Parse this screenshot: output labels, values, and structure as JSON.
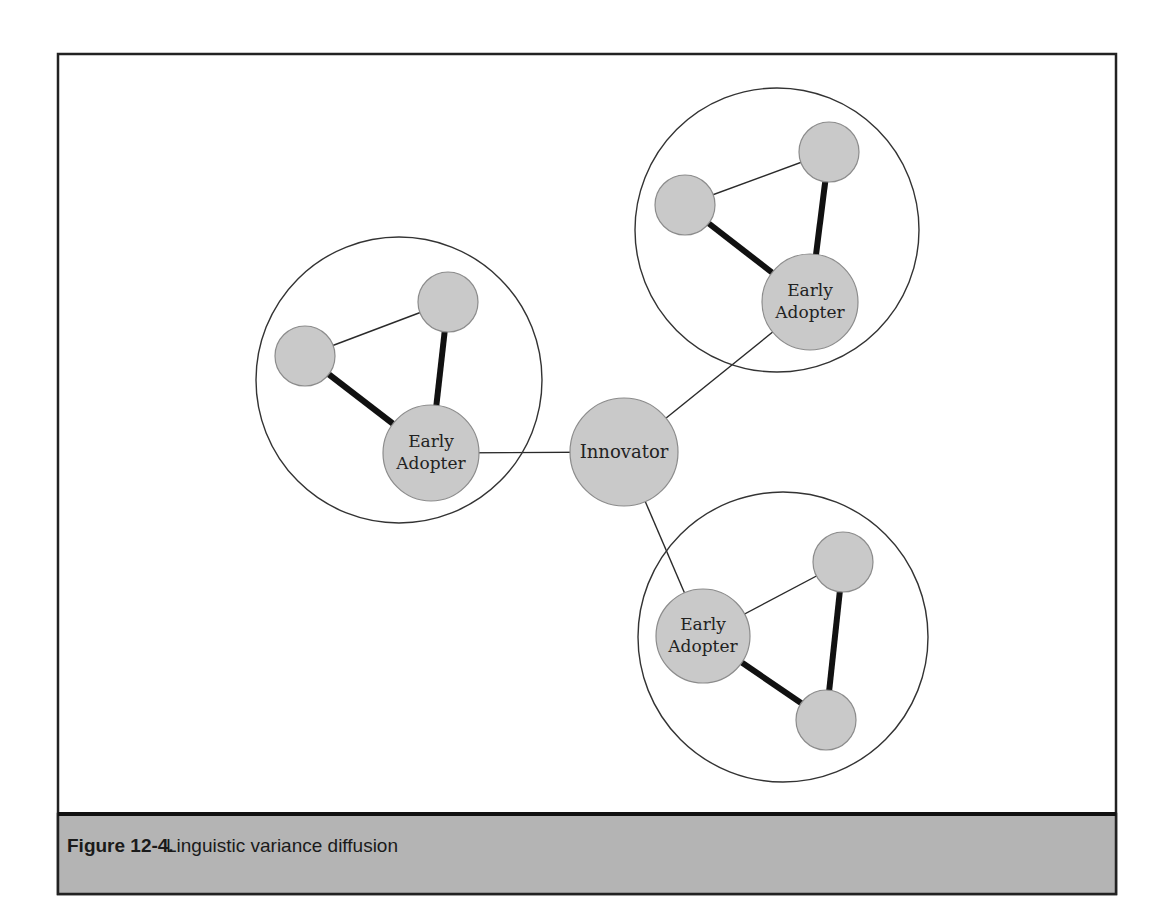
{
  "caption": {
    "number": "Figure 12-4.",
    "title": "Linguistic variance diffusion"
  },
  "diagram": {
    "center_node": {
      "label": "Innovator"
    },
    "clusters": [
      {
        "name": "left",
        "hub_label_line1": "Early",
        "hub_label_line2": "Adopter",
        "members": 2
      },
      {
        "name": "top-right",
        "hub_label_line1": "Early",
        "hub_label_line2": "Adopter",
        "members": 2
      },
      {
        "name": "bottom-right",
        "hub_label_line1": "Early",
        "hub_label_line2": "Adopter",
        "members": 2
      }
    ],
    "legend_notes": {
      "thin_link": "weak tie",
      "thick_link": "strong tie"
    }
  },
  "colors": {
    "node_fill": "#c9c9c9",
    "caption_bar": "#b4b4b4",
    "frame_stroke": "#222222"
  }
}
